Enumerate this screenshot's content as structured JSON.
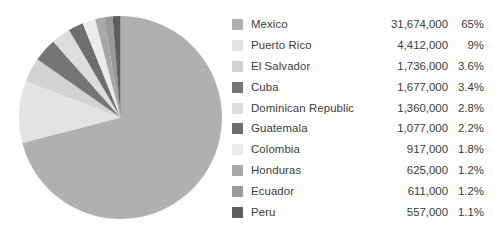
{
  "chart_data": {
    "type": "pie",
    "title": "",
    "subtitle": "",
    "xlabel": "",
    "ylabel": "",
    "legend_position": "right",
    "grid": false,
    "start_angle_deg": 0,
    "direction": "clockwise",
    "categories": [
      "Mexico",
      "Puerto Rico",
      "El Salvador",
      "Cuba",
      "Dominican Republic",
      "Guatemala",
      "Colombia",
      "Honduras",
      "Ecuador",
      "Peru"
    ],
    "values": [
      31674000,
      4412000,
      1736000,
      1677000,
      1360000,
      1077000,
      917000,
      625000,
      611000,
      557000
    ],
    "value_labels": [
      "31,674,000",
      "4,412,000",
      "1,736,000",
      "1,677,000",
      "1,360,000",
      "1,077,000",
      "917,000",
      "625,000",
      "611,000",
      "557,000"
    ],
    "percentages": [
      65,
      9,
      3.6,
      3.4,
      2.8,
      2.2,
      1.8,
      1.2,
      1.2,
      1.1
    ],
    "percent_labels": [
      "65%",
      "9%",
      "3.6%",
      "3.4%",
      "2.8%",
      "2.2%",
      "1.8%",
      "1.2%",
      "1.2%",
      "1.1%"
    ],
    "colors": [
      "#b0b0b0",
      "#e3e3e3",
      "#d2d2d2",
      "#757575",
      "#dcdcdc",
      "#6e6e6e",
      "#ebebeb",
      "#a8a8a8",
      "#9a9a9a",
      "#5e5e5e"
    ]
  },
  "legend": {
    "rows": [
      {
        "label": "Mexico",
        "value": "31,674,000",
        "pct": "65%",
        "color": "#b0b0b0"
      },
      {
        "label": "Puerto Rico",
        "value": "4,412,000",
        "pct": "9%",
        "color": "#e3e3e3"
      },
      {
        "label": "El Salvador",
        "value": "1,736,000",
        "pct": "3.6%",
        "color": "#d2d2d2"
      },
      {
        "label": "Cuba",
        "value": "1,677,000",
        "pct": "3.4%",
        "color": "#757575"
      },
      {
        "label": "Dominican Republic",
        "value": "1,360,000",
        "pct": "2.8%",
        "color": "#dcdcdc"
      },
      {
        "label": "Guatemala",
        "value": "1,077,000",
        "pct": "2.2%",
        "color": "#6e6e6e"
      },
      {
        "label": "Colombia",
        "value": "917,000",
        "pct": "1.8%",
        "color": "#ebebeb"
      },
      {
        "label": "Honduras",
        "value": "625,000",
        "pct": "1.2%",
        "color": "#a8a8a8"
      },
      {
        "label": "Ecuador",
        "value": "611,000",
        "pct": "1.2%",
        "color": "#9a9a9a"
      },
      {
        "label": "Peru",
        "value": "557,000",
        "pct": "1.1%",
        "color": "#5e5e5e"
      }
    ]
  },
  "background_color": "#ffffff",
  "text_color": "#3b3b3b"
}
